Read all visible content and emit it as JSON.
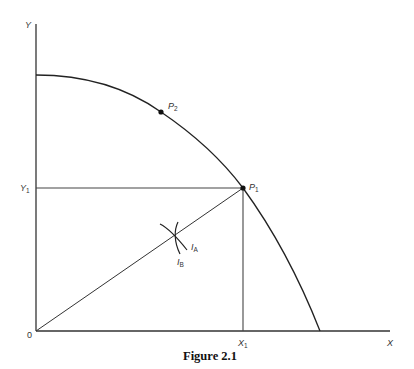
{
  "figure": {
    "caption": "Figure 2.1",
    "axes": {
      "y_label": "Y",
      "x_label": "X",
      "origin_label": "0"
    },
    "points": {
      "p1": {
        "label": "P",
        "subscript": "1"
      },
      "p2": {
        "label": "P",
        "subscript": "2"
      }
    },
    "ticks": {
      "y1": {
        "label": "Y",
        "subscript": "1"
      },
      "x1": {
        "label": "X",
        "subscript": "1"
      }
    },
    "indifference_curves": {
      "ia": {
        "label": "I",
        "subscript": "A"
      },
      "ib": {
        "label": "I",
        "subscript": "B"
      }
    },
    "colors": {
      "line": "#222222",
      "axis": "#333333",
      "text": "#333333"
    }
  }
}
